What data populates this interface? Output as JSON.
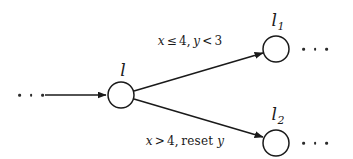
{
  "figure": {
    "type": "state-transition-diagram",
    "background_color": "#ffffff",
    "stroke_color": "#1a1a1a",
    "nodes": [
      {
        "id": "l",
        "label": "l",
        "subscript": "",
        "cx": 121,
        "cy": 95,
        "r": 13,
        "label_x": 123,
        "label_y": 70
      },
      {
        "id": "l1",
        "label": "l",
        "subscript": "1",
        "cx": 276,
        "cy": 49,
        "r": 13,
        "label_x": 278,
        "label_y": 22
      },
      {
        "id": "l2",
        "label": "l",
        "subscript": "2",
        "cx": 276,
        "cy": 143,
        "r": 13,
        "label_x": 278,
        "label_y": 116
      }
    ],
    "edges": [
      {
        "id": "incoming",
        "from": "ellipsis-left",
        "to": "l",
        "guard": null,
        "x1": 45,
        "y1": 95,
        "x2": 106,
        "y2": 95
      },
      {
        "id": "l-to-l1",
        "from": "l",
        "to": "l1",
        "guard_id": "guard-upper",
        "x1": 134,
        "y1": 91,
        "x2": 264,
        "y2": 53
      },
      {
        "id": "l-to-l2",
        "from": "l",
        "to": "l2",
        "guard_id": "guard-lower",
        "x1": 134,
        "y1": 99,
        "x2": 264,
        "y2": 138
      }
    ],
    "guards": [
      {
        "id": "guard-upper",
        "text": "x ≤ 4, y < 3",
        "x": 190,
        "y": 41,
        "tokens": [
          {
            "kind": "var",
            "text": "x"
          },
          {
            "kind": "op",
            "text": "≤"
          },
          {
            "kind": "num",
            "text": "4"
          },
          {
            "kind": "comma",
            "text": ","
          },
          {
            "kind": "var",
            "text": "y"
          },
          {
            "kind": "op",
            "text": "<"
          },
          {
            "kind": "num",
            "text": "3"
          }
        ]
      },
      {
        "id": "guard-lower",
        "text": "x > 4, reset y",
        "x": 185,
        "y": 141,
        "tokens": [
          {
            "kind": "var",
            "text": "x"
          },
          {
            "kind": "op",
            "text": ">"
          },
          {
            "kind": "num",
            "text": "4"
          },
          {
            "kind": "comma",
            "text": ","
          },
          {
            "kind": "kw",
            "text": "reset"
          },
          {
            "kind": "var",
            "text": " y"
          }
        ]
      }
    ],
    "ellipses": [
      {
        "id": "ellipsis-left",
        "x": 31,
        "y": 95,
        "dots": 3
      },
      {
        "id": "ellipsis-right-upper",
        "x": 315,
        "y": 49,
        "dots": 3
      },
      {
        "id": "ellipsis-right-lower",
        "x": 315,
        "y": 143,
        "dots": 3
      }
    ]
  }
}
